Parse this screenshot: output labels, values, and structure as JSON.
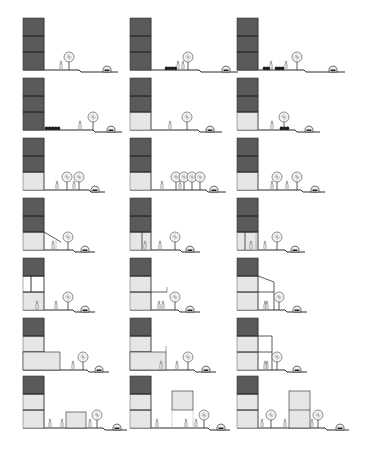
{
  "colors": {
    "background": "#ffffff",
    "dark_floor": "#5a5a5a",
    "light_floor": "#e6e6e6",
    "line": "#2a2a2a",
    "hedge": "#1e1e1e",
    "tree_crown": "#f4f4f4",
    "figure": "#f2f2f2"
  },
  "grid": {
    "rows": 7,
    "cols": 3,
    "col_x": [
      23,
      130,
      237
    ],
    "row_ground_y": [
      70,
      130,
      190,
      250,
      310,
      370,
      428
    ]
  },
  "cells": [
    {
      "id": "r1c1",
      "floors": [
        "dark",
        "dark",
        "dark"
      ],
      "hedges": [],
      "trees": [
        [
          46
        ]
      ],
      "people": [
        [
          38
        ]
      ],
      "extras": [],
      "car": 84,
      "step": 56,
      "end": 95
    },
    {
      "id": "r1c2",
      "floors": [
        "dark",
        "dark",
        "dark"
      ],
      "hedges": [
        [
          35,
          12
        ]
      ],
      "trees": [
        [
          58
        ]
      ],
      "people": [
        [
          48
        ],
        [
          53
        ]
      ],
      "extras": [],
      "car": 96,
      "step": 69,
      "end": 108
    },
    {
      "id": "r1c3",
      "floors": [
        "dark",
        "dark",
        "dark"
      ],
      "hedges": [
        [
          26,
          8
        ],
        [
          38,
          8
        ]
      ],
      "trees": [
        [
          60
        ]
      ],
      "people": [
        [
          34
        ],
        [
          49
        ]
      ],
      "extras": [],
      "car": 96,
      "step": 67,
      "end": 108
    },
    {
      "id": "r2c1",
      "floors": [
        "dark",
        "dark",
        "dark"
      ],
      "hedges": [
        [
          22,
          14
        ]
      ],
      "trees": [
        [
          70
        ]
      ],
      "people": [
        [
          57
        ]
      ],
      "extras": [],
      "car": 88,
      "step": 70,
      "end": 99
    },
    {
      "id": "r2c2",
      "floors": [
        "light",
        "dark",
        "dark"
      ],
      "hedges": [],
      "trees": [
        [
          57
        ]
      ],
      "people": [
        [
          40
        ]
      ],
      "extras": [],
      "car": 80,
      "step": 68,
      "end": 92
    },
    {
      "id": "r2c3",
      "floors": [
        "light",
        "dark",
        "dark"
      ],
      "hedges": [
        [
          43,
          8
        ]
      ],
      "trees": [
        [
          47
        ]
      ],
      "people": [
        [
          35
        ]
      ],
      "extras": [],
      "car": 72,
      "step": 58,
      "end": 83
    },
    {
      "id": "r3c1",
      "floors": [
        "light",
        "dark",
        "dark"
      ],
      "hedges": [],
      "trees": [
        [
          44
        ],
        [
          56
        ]
      ],
      "people": [
        [
          34
        ],
        [
          51
        ]
      ],
      "extras": [],
      "car": 72,
      "step": 66,
      "end": 82
    },
    {
      "id": "r3c2",
      "floors": [
        "light",
        "dark",
        "dark"
      ],
      "hedges": [],
      "trees": [
        [
          46
        ],
        [
          54
        ],
        [
          62
        ],
        [
          70
        ]
      ],
      "people": [
        [
          32
        ],
        [
          50
        ]
      ],
      "extras": [],
      "car": 84,
      "step": 76,
      "end": 96
    },
    {
      "id": "r3c3",
      "floors": [
        "light",
        "dark",
        "dark"
      ],
      "hedges": [],
      "trees": [
        [
          40
        ],
        [
          60
        ]
      ],
      "people": [
        [
          35
        ],
        [
          50
        ]
      ],
      "extras": [],
      "car": 78,
      "step": 64,
      "end": 88
    },
    {
      "id": "r4c1",
      "floors": [
        "light",
        "dark",
        "dark"
      ],
      "hedges": [],
      "trees": [
        [
          45
        ]
      ],
      "people": [
        [
          30
        ]
      ],
      "extras": [
        "slope-canopy"
      ],
      "car": 62,
      "step": 50,
      "end": 72
    },
    {
      "id": "r4c2",
      "floors": [
        "light",
        "dark",
        "dark"
      ],
      "hedges": [],
      "trees": [
        [
          45
        ]
      ],
      "people": [
        [
          15
        ],
        [
          30
        ]
      ],
      "extras": [
        "pilotis-col"
      ],
      "car": 60,
      "step": 50,
      "end": 70
    },
    {
      "id": "r4c3",
      "floors": [
        "light",
        "dark",
        "dark"
      ],
      "hedges": [],
      "trees": [
        [
          40
        ]
      ],
      "people": [
        [
          14
        ],
        [
          28
        ]
      ],
      "extras": [
        "pilotis-two"
      ],
      "car": 58,
      "step": 48,
      "end": 68
    },
    {
      "id": "r5c1",
      "floors": [
        "light",
        "open",
        "dark"
      ],
      "hedges": [],
      "trees": [
        [
          45
        ]
      ],
      "people": [
        [
          33
        ],
        [
          14
        ]
      ],
      "extras": [
        "loggia-top"
      ],
      "car": 62,
      "step": 50,
      "end": 72
    },
    {
      "id": "r5c2",
      "floors": [
        "light",
        "light",
        "dark"
      ],
      "hedges": [],
      "trees": [
        [
          45
        ]
      ],
      "people": [
        [
          33
        ],
        [
          29
        ]
      ],
      "extras": [
        "balcony"
      ],
      "car": 60,
      "step": 48,
      "end": 70
    },
    {
      "id": "r5c3",
      "floors": [
        "light",
        "light",
        "dark"
      ],
      "hedges": [],
      "trees": [
        [
          42
        ]
      ],
      "people": [
        [
          28
        ],
        [
          30
        ]
      ],
      "extras": [
        "annex-sloped"
      ],
      "car": 60,
      "step": 48,
      "end": 70
    },
    {
      "id": "r6c1",
      "floors": [
        "light",
        "light",
        "dark"
      ],
      "hedges": [],
      "trees": [
        [
          60
        ]
      ],
      "people": [
        [
          50
        ]
      ],
      "extras": [
        "podium-wide"
      ],
      "car": 76,
      "step": 64,
      "end": 86
    },
    {
      "id": "r6c2",
      "floors": [
        "light",
        "light",
        "dark"
      ],
      "hedges": [],
      "trees": [
        [
          58
        ]
      ],
      "people": [
        [
          47
        ],
        [
          31
        ]
      ],
      "extras": [
        "podium-terrace"
      ],
      "car": 76,
      "step": 64,
      "end": 86
    },
    {
      "id": "r6c3",
      "floors": [
        "light",
        "light",
        "dark"
      ],
      "hedges": [],
      "trees": [
        [
          40
        ]
      ],
      "people": [
        [
          30
        ],
        [
          28
        ]
      ],
      "extras": [
        "annex-flat"
      ],
      "car": 60,
      "step": 48,
      "end": 70
    },
    {
      "id": "r7c1",
      "floors": [
        "light",
        "light",
        "dark"
      ],
      "hedges": [],
      "trees": [
        [
          74
        ]
      ],
      "people": [
        [
          27
        ],
        [
          39
        ],
        [
          67
        ]
      ],
      "extras": [
        "pavilion-low"
      ],
      "car": 94,
      "step": 80,
      "end": 104
    },
    {
      "id": "r7c2",
      "floors": [
        "light",
        "light",
        "dark"
      ],
      "hedges": [],
      "trees": [
        [
          74
        ]
      ],
      "people": [
        [
          27
        ],
        [
          56
        ],
        [
          66
        ]
      ],
      "extras": [
        "pavilion-raised"
      ],
      "car": 91,
      "step": 78,
      "end": 100
    },
    {
      "id": "r7c3",
      "floors": [
        "light",
        "light",
        "dark"
      ],
      "hedges": [],
      "trees": [
        [
          34
        ],
        [
          81
        ]
      ],
      "people": [
        [
          25
        ],
        [
          48
        ],
        [
          75
        ]
      ],
      "extras": [
        "tower-two"
      ],
      "car": 103,
      "step": 88,
      "end": 112
    }
  ],
  "icons": {
    "tree": "tree-icon",
    "person": "person-icon",
    "car": "car-icon",
    "hedge": "hedge-icon"
  }
}
